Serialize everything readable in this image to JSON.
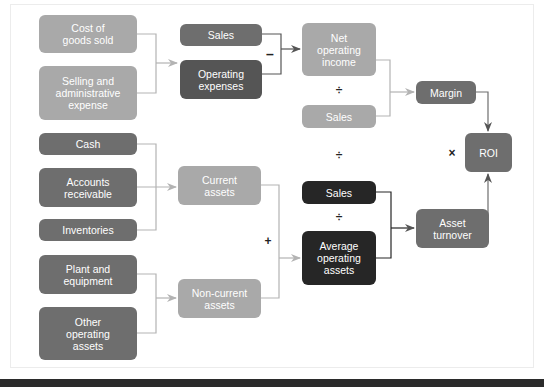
{
  "diagram": {
    "boxes": {
      "cost_of_goods_sold": "Cost of\ngoods sold",
      "selling_admin_expense": "Selling and\nadministrative\nexpense",
      "sales_top": "Sales",
      "operating_expenses": "Operating\nexpenses",
      "net_operating_income": "Net\noperating\nincome",
      "sales_light": "Sales",
      "margin": "Margin",
      "roi": "ROI",
      "cash": "Cash",
      "accounts_receivable": "Accounts\nreceivable",
      "inventories": "Inventories",
      "current_assets": "Current\nassets",
      "plant_equipment": "Plant and\nequipment",
      "other_operating_assets": "Other\noperating\nassets",
      "non_current_assets": "Non-current\nassets",
      "sales_dark": "Sales",
      "average_operating_assets": "Average\noperating\nassets",
      "asset_turnover": "Asset\nturnover"
    },
    "operators": {
      "minus": "–",
      "divide_margin": "÷",
      "divide_middle": "÷",
      "divide_turnover": "÷",
      "multiply": "×",
      "plus": "+"
    },
    "colors": {
      "light": "#a9a9a9",
      "mid": "#6e6e6e",
      "dark": "#262626",
      "line_light": "#b3b3b3",
      "line_dark": "#555555"
    }
  }
}
